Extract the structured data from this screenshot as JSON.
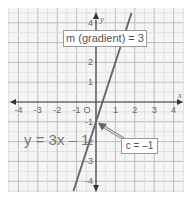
{
  "chart_data": {
    "type": "line",
    "title": "",
    "xlabel": "x",
    "ylabel": "y",
    "xlim": [
      -4.5,
      4.5
    ],
    "ylim": [
      -4.5,
      4.5
    ],
    "grid": true,
    "x_ticks": [
      "-4",
      "-3",
      "-2",
      "-1",
      "1",
      "2",
      "3",
      "4"
    ],
    "y_ticks": [
      "4",
      "2",
      "1",
      "-1",
      "-2",
      "-3",
      "-4"
    ],
    "origin_label": "O",
    "series": [
      {
        "name": "y = 3x - 1",
        "equation": "y = 3x - 1",
        "gradient": 3,
        "intercept": -1,
        "x": [
          -1.1667,
          1.8333
        ],
        "y": [
          -4.5,
          4.5
        ]
      }
    ],
    "annotations": [
      {
        "text": "m (gradient) = 3",
        "type": "boxed-label"
      },
      {
        "text": "c = –1",
        "type": "boxed-label-with-arrow",
        "points_to": [
          0,
          -1
        ]
      },
      {
        "text": "y = 3x – 1",
        "type": "equation-label"
      }
    ]
  },
  "labels": {
    "gradient": "m (gradient) = 3",
    "intercept": "c = –1",
    "equation": "y = 3x – 1",
    "x_axis": "x",
    "y_axis": "y",
    "origin": "O"
  },
  "colors": {
    "grid": "#c8c8c8",
    "grid_bg": "#f4f4f4",
    "axis": "#444444",
    "line": "#666666",
    "arrow": "#7a7a7a",
    "text": "#666666"
  }
}
